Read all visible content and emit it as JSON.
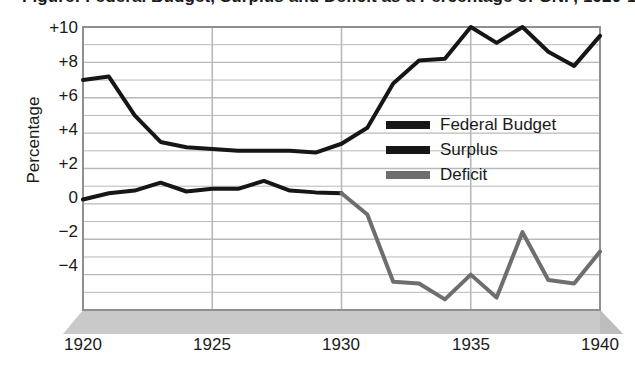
{
  "chart_data": {
    "type": "line",
    "title": "Figure: Federal Budget, Surplus and Deficit as a Percentage of GNP, 1920-1940",
    "xlabel": "",
    "ylabel": "Percentage",
    "xlim": [
      1920,
      1940
    ],
    "ylim": [
      -6,
      10
    ],
    "grid": true,
    "legend_position": "center-right",
    "x_tick_labels": [
      "1920",
      "1925",
      "1930",
      "1935",
      "1940"
    ],
    "x_ticks": [
      1920,
      1925,
      1930,
      1935,
      1940
    ],
    "y_tick_labels": [
      "+10",
      "+8",
      "+6",
      "+4",
      "+2",
      "0",
      "-2",
      "-4"
    ],
    "y_ticks": [
      10,
      8,
      6,
      4,
      2,
      0,
      -2,
      -4
    ],
    "x": [
      1920,
      1921,
      1922,
      1923,
      1924,
      1925,
      1926,
      1927,
      1928,
      1929,
      1930,
      1931,
      1932,
      1933,
      1934,
      1935,
      1936,
      1937,
      1938,
      1939,
      1940
    ],
    "series": [
      {
        "name": "Federal Budget",
        "color": "#161616",
        "width": 4,
        "values": [
          7.0,
          7.2,
          5.0,
          3.5,
          3.2,
          3.1,
          3.0,
          3.0,
          3.0,
          2.9,
          3.4,
          4.3,
          6.8,
          8.1,
          8.2,
          10.0,
          9.1,
          10.0,
          8.6,
          7.8,
          9.5
        ]
      },
      {
        "name": "Surplus",
        "color": "#161616",
        "width": 4,
        "values": [
          0.25,
          0.6,
          0.75,
          1.2,
          0.7,
          0.85,
          0.85,
          1.3,
          0.75,
          0.65,
          0.6,
          null,
          null,
          null,
          null,
          null,
          null,
          null,
          null,
          null,
          null
        ]
      },
      {
        "name": "Deficit",
        "color": "#6e6e6e",
        "width": 4,
        "values": [
          null,
          null,
          null,
          null,
          null,
          null,
          null,
          null,
          null,
          null,
          0.6,
          -0.6,
          -4.4,
          -4.5,
          -5.4,
          -4.0,
          -5.3,
          -1.6,
          -4.3,
          -4.5,
          -2.7
        ]
      }
    ]
  },
  "axis": {
    "ylabel": "Percentage",
    "yticks": [
      "+10",
      "+8",
      "+6",
      "+4",
      "+2",
      "0",
      "−2",
      "−4"
    ],
    "xticks": [
      "1920",
      "1925",
      "1930",
      "1935",
      "1940"
    ]
  },
  "legend": {
    "items": [
      {
        "label": "Federal Budget",
        "color": "#161616"
      },
      {
        "label": "Surplus",
        "color": "#161616"
      },
      {
        "label": "Deficit",
        "color": "#6e6e6e"
      }
    ]
  },
  "title": {
    "text": "Figure: Federal Budget, Surplus and Deficit as a Percentage of GNP, 1920-1940"
  },
  "colors": {
    "grid": "#b9b9b9",
    "axis": "#8f8f8f",
    "floor": "#c9c9c9",
    "floor_edge": "#b0b0b0",
    "text": "#1a1a1a"
  }
}
